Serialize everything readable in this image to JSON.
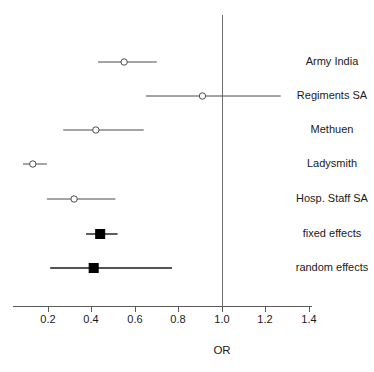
{
  "chart_data": {
    "type": "forest",
    "title": "",
    "xlabel": "OR",
    "ylabel": "",
    "xlim": [
      0.13,
      1.5
    ],
    "xticks": [
      0.2,
      0.4,
      0.6,
      0.8,
      1.0,
      1.2,
      1.4
    ],
    "xticklabels": [
      "0.2",
      "0.4",
      "0.6",
      "0.8",
      "1.0",
      "1.2",
      "1.4"
    ],
    "reference_line": 1.0,
    "grid": false,
    "legend": "",
    "rows": [
      {
        "label": "Army India",
        "estimate": 0.55,
        "ci_low": 0.43,
        "ci_high": 0.7,
        "marker": "open-circle",
        "kind": "study"
      },
      {
        "label": "Regiments SA",
        "estimate": 0.91,
        "ci_low": 0.65,
        "ci_high": 1.27,
        "marker": "open-circle",
        "kind": "study"
      },
      {
        "label": "Methuen",
        "estimate": 0.42,
        "ci_low": 0.27,
        "ci_high": 0.64,
        "marker": "open-circle",
        "kind": "study"
      },
      {
        "label": "Ladysmith",
        "estimate": 0.13,
        "ci_low": 0.085,
        "ci_high": 0.195,
        "marker": "open-circle",
        "kind": "study"
      },
      {
        "label": "Hosp. Staff SA",
        "estimate": 0.32,
        "ci_low": 0.195,
        "ci_high": 0.51,
        "marker": "open-circle",
        "kind": "study"
      },
      {
        "label": "fixed effects",
        "estimate": 0.44,
        "ci_low": 0.375,
        "ci_high": 0.52,
        "marker": "filled-square",
        "kind": "summary"
      },
      {
        "label": "random effects",
        "estimate": 0.41,
        "ci_low": 0.21,
        "ci_high": 0.77,
        "marker": "filled-square",
        "kind": "summary"
      }
    ],
    "colors": {
      "axis": "#5a5a5a",
      "reference": "#6e6e6e",
      "study_marker": "#4a4a4a",
      "summary_marker": "#000000",
      "text": "#1a1a1a",
      "background": "#ffffff"
    }
  },
  "axis": {
    "label": "OR"
  },
  "ticks": {
    "t1": "0.2",
    "t2": "0.4",
    "t3": "0.6",
    "t4": "0.8",
    "t5": "1.0",
    "t6": "1.2",
    "t7": "1.4"
  },
  "rows": {
    "r0": "Army India",
    "r1": "Regiments SA",
    "r2": "Methuen",
    "r3": "Ladysmith",
    "r4": "Hosp. Staff SA",
    "r5": "fixed effects",
    "r6": "random effects"
  }
}
